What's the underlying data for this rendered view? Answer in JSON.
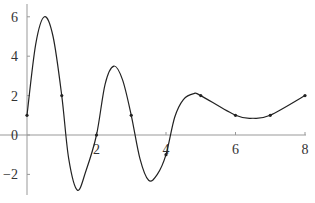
{
  "chart_data": {
    "type": "line",
    "title": "",
    "xlabel": "",
    "ylabel": "",
    "xlim": [
      0,
      8
    ],
    "ylim": [
      -3,
      6.5
    ],
    "x_ticks": [
      "2",
      "4",
      "6",
      "8"
    ],
    "y_ticks": [
      "6",
      "4",
      "2",
      "0",
      "−2"
    ],
    "grid": false,
    "legend": null,
    "series": [
      {
        "name": "interpolated points",
        "points": [
          [
            0,
            1
          ],
          [
            1,
            2
          ],
          [
            2,
            0
          ],
          [
            3,
            1
          ],
          [
            4,
            -1
          ],
          [
            5,
            2
          ],
          [
            6,
            1
          ],
          [
            7,
            1
          ],
          [
            8,
            2
          ]
        ]
      },
      {
        "name": "curve (approx.)",
        "points": [
          [
            0,
            1
          ],
          [
            0.25,
            4.6
          ],
          [
            0.5,
            6
          ],
          [
            0.75,
            5.0
          ],
          [
            1,
            2
          ],
          [
            1.2,
            -1.2
          ],
          [
            1.45,
            -2.8
          ],
          [
            1.7,
            -1.8
          ],
          [
            2,
            0
          ],
          [
            2.25,
            2.6
          ],
          [
            2.5,
            3.5
          ],
          [
            2.75,
            2.8
          ],
          [
            3,
            1
          ],
          [
            3.25,
            -1.2
          ],
          [
            3.5,
            -2.3
          ],
          [
            3.75,
            -2.0
          ],
          [
            4,
            -1
          ],
          [
            4.25,
            0.9
          ],
          [
            4.5,
            1.8
          ],
          [
            4.8,
            2.1
          ],
          [
            5,
            2
          ],
          [
            6,
            1
          ],
          [
            6.5,
            0.85
          ],
          [
            7,
            1
          ],
          [
            8,
            2
          ]
        ]
      }
    ],
    "line_color": "#222222",
    "axis_color": "#999999"
  }
}
